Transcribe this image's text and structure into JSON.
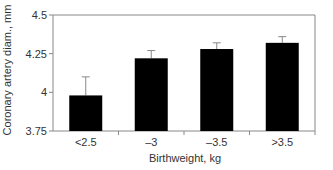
{
  "chart_data": {
    "type": "bar",
    "title": "",
    "xlabel": "Birthweight, kg",
    "ylabel": "Coronary artery diam., mm",
    "categories": [
      "<2.5",
      "–3",
      "–3.5",
      ">3.5"
    ],
    "values": [
      3.98,
      4.22,
      4.28,
      4.32
    ],
    "error_upper": [
      4.1,
      4.27,
      4.32,
      4.36
    ],
    "ylim": [
      3.75,
      4.5
    ],
    "yticks": [
      3.75,
      4,
      4.25,
      4.5
    ],
    "ytick_labels": [
      "3.75",
      "4",
      "4.25",
      "4.5"
    ],
    "grid": false,
    "legend": "none",
    "bar_color": "#000000",
    "axis_color": "#888888"
  }
}
